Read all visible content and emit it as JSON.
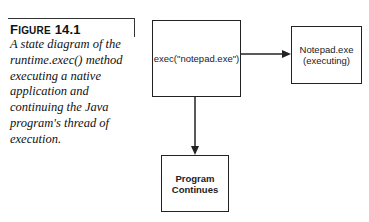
{
  "figure": {
    "label_prefix": "F",
    "label_rest": "IGURE",
    "label_number": "14.1",
    "caption": "A state diagram of the runtime.exec() method executing a native application and continuing the Java program's thread of execution."
  },
  "diagram": {
    "nodes": [
      {
        "id": "exec",
        "lines": [
          "exec(\"notepad.exe\")"
        ]
      },
      {
        "id": "notepad",
        "lines": [
          "Notepad.exe",
          "(executing)"
        ]
      },
      {
        "id": "continue",
        "lines": [
          "Program",
          "Continues"
        ]
      }
    ],
    "edges": [
      {
        "from": "exec",
        "to": "notepad",
        "direction": "right"
      },
      {
        "from": "exec",
        "to": "continue",
        "direction": "down"
      }
    ],
    "colors": {
      "stroke": "#222222",
      "background": "#ffffff"
    }
  }
}
